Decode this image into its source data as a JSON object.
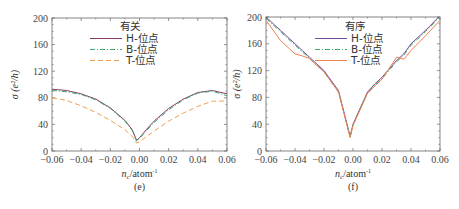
{
  "chart_data": [
    {
      "type": "line",
      "panel_label": "(e)",
      "legend_title": "有关",
      "xlabel": "n_c / atom⁻¹",
      "ylabel": "σ (e²/h)",
      "xlim": [
        -0.06,
        0.06
      ],
      "ylim": [
        0,
        200
      ],
      "xticks": [
        "−0.06",
        "−0.04",
        "−0.02",
        "0.00",
        "0.02",
        "0.04",
        "0.06"
      ],
      "yticks": [
        "0",
        "40",
        "80",
        "120",
        "160",
        "200"
      ],
      "x": [
        -0.06,
        -0.05,
        -0.04,
        -0.03,
        -0.02,
        -0.01,
        -0.005,
        -0.002,
        0.0,
        0.005,
        0.01,
        0.02,
        0.03,
        0.04,
        0.05,
        0.06
      ],
      "series": [
        {
          "name": "H-位点",
          "color": "#8a3a6a",
          "style": "solid",
          "values": [
            93,
            91,
            86,
            78,
            65,
            46,
            32,
            16,
            20,
            33,
            45,
            64,
            78,
            88,
            91,
            86
          ]
        },
        {
          "name": "B-位点",
          "color": "#3aa86a",
          "style": "dashdot",
          "values": [
            91,
            89,
            85,
            77,
            64,
            45,
            31,
            15,
            19,
            31,
            43,
            62,
            77,
            87,
            90,
            83
          ]
        },
        {
          "name": "T-位点",
          "color": "#f0a050",
          "style": "dashed",
          "values": [
            80,
            76,
            68,
            58,
            46,
            32,
            22,
            12,
            14,
            22,
            30,
            45,
            57,
            67,
            75,
            75
          ]
        }
      ]
    },
    {
      "type": "line",
      "panel_label": "(f)",
      "legend_title": "有序",
      "xlabel": "n_c / atom⁻¹",
      "ylabel": "σ (e²/h)",
      "xlim": [
        -0.06,
        0.06
      ],
      "ylim": [
        0,
        200
      ],
      "xticks": [
        "−0.06",
        "−0.04",
        "−0.02",
        "0.00",
        "0.02",
        "0.04",
        "0.06"
      ],
      "yticks": [
        "0",
        "40",
        "80",
        "120",
        "160",
        "200"
      ],
      "x": [
        -0.06,
        -0.05,
        -0.04,
        -0.035,
        -0.03,
        -0.02,
        -0.01,
        -0.002,
        0.0,
        0.01,
        0.015,
        0.02,
        0.03,
        0.035,
        0.04,
        0.05,
        0.06
      ],
      "series": [
        {
          "name": "H-位点",
          "color": "#7a4a9a",
          "style": "solid",
          "values": [
            200,
            180,
            160,
            150,
            140,
            120,
            90,
            22,
            40,
            88,
            100,
            110,
            135,
            145,
            160,
            180,
            202
          ]
        },
        {
          "name": "B-位点",
          "color": "#3aa86a",
          "style": "dashdot",
          "values": [
            198,
            178,
            158,
            148,
            138,
            118,
            88,
            21,
            39,
            87,
            98,
            108,
            133,
            143,
            158,
            178,
            200
          ]
        },
        {
          "name": "T-位点",
          "color": "#f08050",
          "style": "solid",
          "values": [
            195,
            165,
            145,
            142,
            138,
            118,
            88,
            20,
            38,
            86,
            97,
            107,
            140,
            137,
            150,
            172,
            195
          ]
        }
      ]
    }
  ],
  "panels": [
    {
      "label": "(e)",
      "legend_title": "有关",
      "legend": [
        "H-位点",
        "B-位点",
        "T-位点"
      ],
      "xlabel_main": "n",
      "xlabel_sub": "c",
      "xlabel_unit": "/atom",
      "xlabel_sup": "-1",
      "ylabel": "σ (e²/h)"
    },
    {
      "label": "(f)",
      "legend_title": "有序",
      "legend": [
        "H-位点",
        "B-位点",
        "T-位点"
      ],
      "xlabel_main": "n",
      "xlabel_sub": "c",
      "xlabel_unit": "/atom",
      "xlabel_sup": "-1",
      "ylabel": "σ (e²/h)"
    }
  ]
}
